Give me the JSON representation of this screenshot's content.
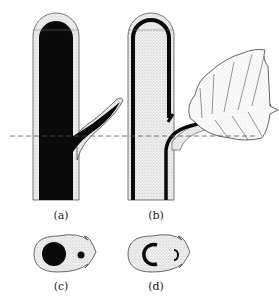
{
  "figure": {
    "panels": [
      {
        "id": "a",
        "label": "(a)",
        "description": "Longitudinal section of stem with branch, dark vascular core"
      },
      {
        "id": "b",
        "label": "(b)",
        "description": "Longitudinal section of stem with leaf trace and leaf blade"
      },
      {
        "id": "c",
        "label": "(c)",
        "description": "Cross-section at dashed line of (a), solid stele and branch trace"
      },
      {
        "id": "d",
        "label": "(d)",
        "description": "Cross-section at dashed line of (b), C-shaped stele with leaf gap"
      }
    ],
    "section_line": "dashed horizontal line",
    "colors": {
      "ink": "#111111",
      "stipple": "#d9d9d9",
      "background": "#ffffff"
    }
  }
}
